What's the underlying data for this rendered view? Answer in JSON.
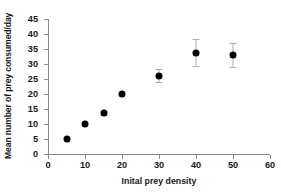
{
  "chart_data": {
    "type": "scatter",
    "title": "",
    "xlabel": "Inital prey density",
    "ylabel": "Mean number of prey consumed/day",
    "xlim": [
      0,
      60
    ],
    "ylim": [
      0,
      45
    ],
    "xticks": [
      0,
      10,
      20,
      30,
      40,
      50,
      60
    ],
    "yticks": [
      0,
      5,
      10,
      15,
      20,
      25,
      30,
      35,
      40,
      45
    ],
    "xticklabels": [
      "0",
      "10",
      "20",
      "30",
      "40",
      "50",
      "60"
    ],
    "yticklabels": [
      "0",
      "5",
      "10",
      "15",
      "20",
      "25",
      "30",
      "35",
      "40",
      "45"
    ],
    "grid": false,
    "legend": false,
    "marker_color": "#000000",
    "errorbar_color": "#aeaeae",
    "axis_color": "#8a8a8a",
    "x": [
      5,
      10,
      15,
      20,
      30,
      40,
      50
    ],
    "y": [
      5.0,
      10.0,
      13.7,
      20.0,
      26.1,
      33.8,
      33.0
    ],
    "yerr": [
      0.0,
      0.0,
      0.6,
      0.0,
      2.1,
      4.6,
      3.9
    ],
    "points": [
      {
        "x": 5,
        "y": 5.0,
        "yerr": 0.0
      },
      {
        "x": 10,
        "y": 10.0,
        "yerr": 0.0
      },
      {
        "x": 15,
        "y": 13.7,
        "yerr": 0.6
      },
      {
        "x": 20,
        "y": 20.0,
        "yerr": 0.0
      },
      {
        "x": 30,
        "y": 26.1,
        "yerr": 2.1
      },
      {
        "x": 40,
        "y": 33.8,
        "yerr": 4.6
      },
      {
        "x": 50,
        "y": 33.0,
        "yerr": 3.9
      }
    ]
  }
}
